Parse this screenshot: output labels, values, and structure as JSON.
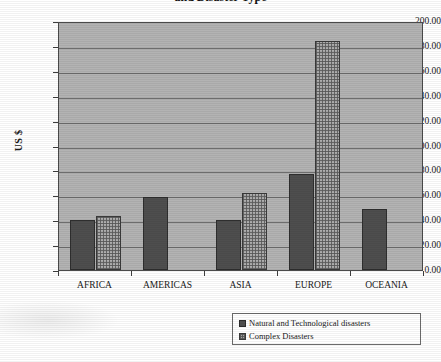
{
  "chart_data": {
    "type": "bar",
    "title": "and Disaster Type",
    "subtitle": "",
    "xlabel": "",
    "ylabel": "US $",
    "categories": [
      "AFRICA",
      "AMERICAS",
      "ASIA",
      "EUROPE",
      "OCEANIA"
    ],
    "series": [
      {
        "name": "Natural and Technological disasters",
        "values": [
          40.0,
          59.0,
          40.0,
          77.0,
          49.0
        ],
        "color": "#4e4e4e"
      },
      {
        "name": "Complex Disasters",
        "values": [
          43.0,
          0.0,
          62.0,
          184.0,
          0.0
        ],
        "color": "#adadad"
      }
    ],
    "ylim": [
      0,
      200
    ],
    "ytick_step": 20,
    "ytick_labels": [
      "200.00",
      "180.00",
      "160.00",
      "140.00",
      "120.00",
      "100.00",
      "80.00",
      "60.00",
      "40.00",
      "20.00",
      "0.00"
    ],
    "grid": true,
    "legend_position": "bottom-right",
    "plot_background": "#b3b3b3"
  },
  "legend": {
    "items": [
      {
        "label": "Natural and Technological disasters"
      },
      {
        "label": "Complex Disasters"
      }
    ]
  }
}
